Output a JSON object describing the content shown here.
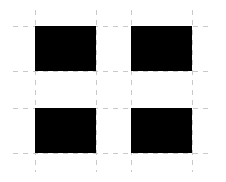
{
  "figure": {
    "width": 226,
    "height": 182,
    "background_color": "#ffffff"
  },
  "chart_data": {
    "type": "heatmap",
    "subtitle": "",
    "xlabel": "",
    "ylabel": "",
    "grid": true,
    "legend": "none",
    "colors": {
      "filled": "#000000",
      "empty": "#ffffff",
      "gridline": "#c9c9c9",
      "background": "#ffffff"
    },
    "grid_lines": {
      "vertical_x": [
        35,
        96,
        131,
        192
      ],
      "horizontal_y": [
        26,
        71,
        108,
        153
      ],
      "vertical_extent_y": [
        10,
        172
      ],
      "horizontal_extent_x": [
        13,
        213
      ],
      "dash_length": 5,
      "dash_gap": 5,
      "line_width": 1
    },
    "xlim": [
      0,
      226
    ],
    "ylim": [
      0,
      182
    ],
    "columns": [
      "left",
      "center",
      "right"
    ],
    "rows": [
      "top",
      "middle",
      "bottom"
    ],
    "values": [
      [
        1,
        0,
        1
      ],
      [
        0,
        0,
        0
      ],
      [
        1,
        0,
        1
      ]
    ],
    "cells": [
      {
        "name": "top-left",
        "row": "top",
        "column": "left",
        "value": 1,
        "filled": true,
        "color": "#000000",
        "x": 35,
        "y": 26,
        "width": 61,
        "height": 45
      },
      {
        "name": "top-center",
        "row": "top",
        "column": "center",
        "value": 0,
        "filled": false,
        "color": "#ffffff",
        "x": 96,
        "y": 26,
        "width": 35,
        "height": 45
      },
      {
        "name": "top-right",
        "row": "top",
        "column": "right",
        "value": 1,
        "filled": true,
        "color": "#000000",
        "x": 131,
        "y": 26,
        "width": 61,
        "height": 45
      },
      {
        "name": "middle-left",
        "row": "middle",
        "column": "left",
        "value": 0,
        "filled": false,
        "color": "#ffffff",
        "x": 35,
        "y": 71,
        "width": 61,
        "height": 37
      },
      {
        "name": "middle-center",
        "row": "middle",
        "column": "center",
        "value": 0,
        "filled": false,
        "color": "#ffffff",
        "x": 96,
        "y": 71,
        "width": 35,
        "height": 37
      },
      {
        "name": "middle-right",
        "row": "middle",
        "column": "right",
        "value": 0,
        "filled": false,
        "color": "#ffffff",
        "x": 131,
        "y": 71,
        "width": 61,
        "height": 37
      },
      {
        "name": "bottom-left",
        "row": "bottom",
        "column": "left",
        "value": 1,
        "filled": true,
        "color": "#000000",
        "x": 35,
        "y": 108,
        "width": 61,
        "height": 45
      },
      {
        "name": "bottom-center",
        "row": "bottom",
        "column": "center",
        "value": 0,
        "filled": false,
        "color": "#ffffff",
        "x": 96,
        "y": 108,
        "width": 35,
        "height": 45
      },
      {
        "name": "bottom-right",
        "row": "bottom",
        "column": "right",
        "value": 1,
        "filled": true,
        "color": "#000000",
        "x": 131,
        "y": 108,
        "width": 61,
        "height": 45
      }
    ]
  }
}
